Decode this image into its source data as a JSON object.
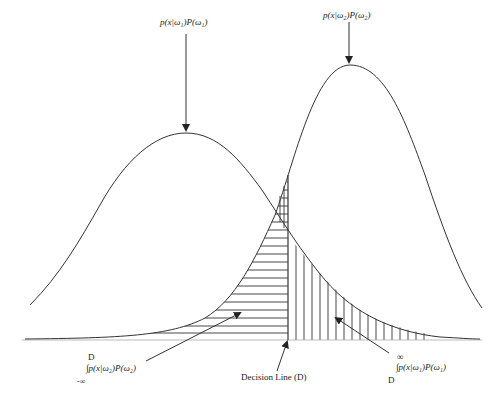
{
  "diagram": {
    "title": "",
    "type": "bayes-decision-error-regions",
    "labels": {
      "curve1_label": "p(x|ω₁)P(ω₁)",
      "curve2_label": "p(x|ω₂)P(ω₂)",
      "decision_line_label": "Decision Line (D)",
      "left_integral": {
        "upper_limit": "D",
        "integrand": "∫p(x|ω₂)P(ω₂)",
        "lower_limit": "-∞"
      },
      "right_integral": {
        "upper_limit": "∞",
        "integrand": "∫p(x|ω₁)P(ω₁)",
        "lower_limit": "D"
      }
    },
    "elements": [
      {
        "name": "curve-omega1",
        "kind": "gaussian",
        "peak_x": 186,
        "peak_y": 133
      },
      {
        "name": "curve-omega2",
        "kind": "gaussian",
        "peak_x": 350,
        "peak_y": 65
      },
      {
        "name": "decision-line",
        "kind": "vertical-line",
        "x": 288
      },
      {
        "name": "region-left-of-D",
        "hatch": "horizontal",
        "meaning": "error area under ω₂ curve left of D"
      },
      {
        "name": "region-right-of-D",
        "hatch": "vertical",
        "meaning": "error area under ω₁ curve right of D"
      },
      {
        "name": "baseline",
        "kind": "x-axis"
      }
    ],
    "colors": {
      "stroke": "#333333",
      "background": "#ffffff"
    }
  }
}
